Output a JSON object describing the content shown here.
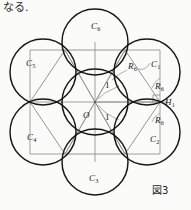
{
  "page": {
    "top_note": "なる.",
    "caption": "図3",
    "width": 191,
    "height": 210,
    "background": "#fbfbfa"
  },
  "figure": {
    "name": "seven-circle-hexagon-packing",
    "colors": {
      "circle_stroke": "#1a1a1a",
      "construction_stroke": "#7d7d7d",
      "text": "#1a1a1a"
    },
    "geometry": {
      "center": {
        "x": 95,
        "y": 102
      },
      "circle_radius": 33,
      "ring_distance": 60,
      "right_angle_marker": {
        "x": 160,
        "y": 102,
        "size": 7
      }
    },
    "circles": [
      {
        "id": "center",
        "label": "O",
        "cx": 95,
        "cy": 102,
        "r": 33
      },
      {
        "id": "c1",
        "label": "C",
        "sub": "1",
        "cx": 125,
        "cy": 50,
        "r": 33
      },
      {
        "id": "c2",
        "label": "C",
        "sub": "2",
        "cx": 125,
        "cy": 154,
        "r": 33
      },
      {
        "id": "c3",
        "label": "C",
        "sub": "3",
        "cx": 95,
        "cy": 162,
        "r": 33
      },
      {
        "id": "c4",
        "label": "C",
        "sub": "4",
        "cx": 40,
        "cy": 154,
        "r": 33
      },
      {
        "id": "c5",
        "label": "C",
        "sub": "5",
        "cx": 40,
        "cy": 50,
        "r": 33
      },
      {
        "id": "c6",
        "label": "C",
        "sub": "6",
        "cx": 95,
        "cy": 42,
        "r": 33
      }
    ],
    "labels": [
      {
        "id": "lbl-c6",
        "text": "C",
        "sub": "6",
        "x": 91,
        "y": 27,
        "kind": "italic"
      },
      {
        "id": "lbl-c5",
        "text": "C",
        "sub": "5",
        "x": 28,
        "y": 63,
        "kind": "italic"
      },
      {
        "id": "lbl-c1",
        "text": "C",
        "sub": "1",
        "x": 151,
        "y": 64,
        "kind": "italic"
      },
      {
        "id": "lbl-c4",
        "text": "C",
        "sub": "4",
        "x": 29,
        "y": 137,
        "kind": "italic"
      },
      {
        "id": "lbl-c2",
        "text": "C",
        "sub": "2",
        "x": 150,
        "y": 139,
        "kind": "italic"
      },
      {
        "id": "lbl-c3",
        "text": "C",
        "sub": "3",
        "x": 90,
        "y": 177,
        "kind": "italic"
      },
      {
        "id": "lbl-h1",
        "text": "H",
        "sub": "1",
        "x": 165,
        "y": 99,
        "kind": "italic"
      },
      {
        "id": "lbl-o",
        "text": "O",
        "sub": "",
        "x": 84,
        "y": 113,
        "kind": "italic"
      },
      {
        "id": "lbl-r6-a",
        "text": "R",
        "sub": "6",
        "x": 129,
        "y": 66,
        "kind": "italic"
      },
      {
        "id": "lbl-r6-b",
        "text": "R",
        "sub": "6",
        "x": 155,
        "y": 86,
        "kind": "italic"
      },
      {
        "id": "lbl-r6-c",
        "text": "R",
        "sub": "6",
        "x": 155,
        "y": 120,
        "kind": "italic"
      },
      {
        "id": "lbl-one-top",
        "text": "1",
        "sub": "",
        "x": 106,
        "y": 86,
        "kind": "plain"
      },
      {
        "id": "lbl-one-bot",
        "text": "1",
        "sub": "",
        "x": 106,
        "y": 117,
        "kind": "plain"
      }
    ]
  }
}
